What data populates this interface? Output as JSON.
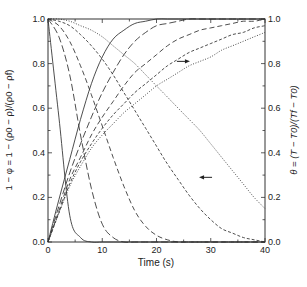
{
  "chart_data": {
    "type": "line",
    "title": "",
    "xlabel": "Time (s)",
    "ylabel_left": "1 − φ = 1 − (ρ0 − ρ)/(ρ0 − ρf)",
    "ylabel_right": "θ = (T − T0)/(Tf − T0)",
    "xlim": [
      0,
      40
    ],
    "ylim": [
      0,
      1
    ],
    "x_ticks": [
      0,
      10,
      20,
      30,
      40
    ],
    "y_ticks": [
      "0.0",
      "0.2",
      "0.4",
      "0.6",
      "0.8",
      "1.0"
    ],
    "grid": false,
    "legend": "none",
    "annotations": [
      {
        "type": "arrow",
        "direction": "right",
        "x": 24.5,
        "y": 0.81,
        "meaning": "dotted rising curve refers to right axis θ"
      },
      {
        "type": "arrow",
        "direction": "left",
        "x": 29.5,
        "y": 0.29,
        "meaning": "dotted decreasing curve refers to left axis 1−φ"
      }
    ],
    "x": [
      0,
      2,
      4,
      6,
      8,
      10,
      12,
      14,
      16,
      18,
      20,
      22,
      24,
      26,
      28,
      30,
      32,
      34,
      36,
      38,
      40
    ],
    "series": [
      {
        "name": "1-phi solid",
        "axis": "left",
        "style": "solid",
        "values": [
          1.0,
          0.56,
          0.12,
          0.02,
          0.0,
          0.0,
          0.0,
          0.0,
          0.0,
          0.0,
          0.0,
          0.0,
          0.0,
          0.0,
          0.0,
          0.0,
          0.0,
          0.0,
          0.0,
          0.0,
          0.0
        ]
      },
      {
        "name": "1-phi long-dash",
        "axis": "left",
        "style": "longdash",
        "values": [
          1.0,
          0.92,
          0.75,
          0.48,
          0.24,
          0.08,
          0.02,
          0.0,
          0.0,
          0.0,
          0.0,
          0.0,
          0.0,
          0.0,
          0.0,
          0.0,
          0.0,
          0.0,
          0.0,
          0.0,
          0.0
        ]
      },
      {
        "name": "1-phi dash",
        "axis": "left",
        "style": "dash",
        "values": [
          1.0,
          0.97,
          0.9,
          0.79,
          0.66,
          0.52,
          0.38,
          0.25,
          0.14,
          0.07,
          0.03,
          0.01,
          0.0,
          0.0,
          0.0,
          0.0,
          0.0,
          0.0,
          0.0,
          0.0,
          0.0
        ]
      },
      {
        "name": "1-phi short-dash",
        "axis": "left",
        "style": "shortdash",
        "values": [
          1.0,
          0.99,
          0.97,
          0.93,
          0.88,
          0.82,
          0.75,
          0.67,
          0.59,
          0.51,
          0.43,
          0.35,
          0.28,
          0.21,
          0.15,
          0.1,
          0.06,
          0.04,
          0.02,
          0.01,
          0.0
        ]
      },
      {
        "name": "1-phi dotted",
        "axis": "left",
        "style": "dotted",
        "values": [
          1.0,
          1.0,
          0.99,
          0.97,
          0.95,
          0.92,
          0.88,
          0.84,
          0.8,
          0.75,
          0.7,
          0.65,
          0.6,
          0.55,
          0.5,
          0.44,
          0.38,
          0.32,
          0.26,
          0.2,
          0.15
        ]
      },
      {
        "name": "theta solid",
        "axis": "right",
        "style": "solid",
        "values": [
          0.0,
          0.19,
          0.37,
          0.55,
          0.71,
          0.83,
          0.91,
          0.95,
          0.98,
          0.99,
          1.0,
          1.0,
          1.0,
          1.0,
          1.0,
          1.0,
          1.0,
          1.0,
          1.0,
          1.0,
          1.0
        ]
      },
      {
        "name": "theta long-dash",
        "axis": "right",
        "style": "longdash",
        "values": [
          0.0,
          0.16,
          0.31,
          0.44,
          0.56,
          0.67,
          0.76,
          0.84,
          0.9,
          0.94,
          0.97,
          0.98,
          0.99,
          1.0,
          1.0,
          1.0,
          1.0,
          1.0,
          1.0,
          1.0,
          1.0
        ]
      },
      {
        "name": "theta dash",
        "axis": "right",
        "style": "dash",
        "values": [
          0.0,
          0.14,
          0.28,
          0.38,
          0.48,
          0.56,
          0.63,
          0.7,
          0.76,
          0.8,
          0.84,
          0.88,
          0.91,
          0.93,
          0.95,
          0.96,
          0.97,
          0.98,
          0.99,
          0.99,
          1.0
        ]
      },
      {
        "name": "theta short-dash",
        "axis": "right",
        "style": "shortdash",
        "values": [
          0.0,
          0.13,
          0.26,
          0.36,
          0.44,
          0.51,
          0.57,
          0.62,
          0.67,
          0.71,
          0.75,
          0.79,
          0.82,
          0.85,
          0.87,
          0.89,
          0.91,
          0.93,
          0.94,
          0.96,
          0.97
        ]
      },
      {
        "name": "theta dotted",
        "axis": "right",
        "style": "dotted",
        "values": [
          0.0,
          0.13,
          0.25,
          0.34,
          0.42,
          0.48,
          0.53,
          0.58,
          0.62,
          0.66,
          0.7,
          0.73,
          0.76,
          0.79,
          0.81,
          0.83,
          0.86,
          0.88,
          0.9,
          0.92,
          0.94
        ]
      }
    ]
  },
  "axes": {
    "x_tick_labels": [
      "0",
      "10",
      "20",
      "30",
      "40"
    ],
    "y_left_tick_labels": [
      "0.0",
      "0.2",
      "0.4",
      "0.6",
      "0.8",
      "1.0"
    ],
    "y_right_tick_labels": [
      "0.0",
      "0.2",
      "0.4",
      "0.6",
      "0.8",
      "1.0"
    ],
    "xlabel": "Time (s)",
    "ylabel_left": "1 − φ = 1 − (ρ0 − ρ)/(ρ0 − ρf)",
    "ylabel_right": "θ = (T − T0)/(Tf − T0)"
  },
  "colors": {
    "axis": "#333333",
    "line": "#3a3a3a",
    "text": "#222222",
    "background": "#ffffff"
  }
}
